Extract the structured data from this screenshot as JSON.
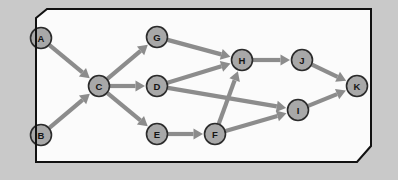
{
  "diagram": {
    "type": "directed-graph",
    "canvas": {
      "width": 398,
      "height": 180
    },
    "colors": {
      "page_background": "#c9c9c9",
      "panel_background": "#fbfbfb",
      "panel_border": "#111111",
      "node_fill": "#a8a8a8",
      "node_border": "#2b2b2b",
      "node_label": "#151515",
      "edge": "#8c8c8c"
    },
    "panel": {
      "points": "36,18 47,9 371,9 371,146 357,162 36,162",
      "bevel_corners": [
        "top-left",
        "bottom-right"
      ]
    },
    "node_radius": 10.5,
    "nodes": [
      {
        "id": "A",
        "label": "A",
        "cx": 41,
        "cy": 38
      },
      {
        "id": "B",
        "label": "B",
        "cx": 41,
        "cy": 135
      },
      {
        "id": "C",
        "label": "C",
        "cx": 99,
        "cy": 86
      },
      {
        "id": "G",
        "label": "G",
        "cx": 157,
        "cy": 37
      },
      {
        "id": "D",
        "label": "D",
        "cx": 157,
        "cy": 86
      },
      {
        "id": "E",
        "label": "E",
        "cx": 157,
        "cy": 134
      },
      {
        "id": "F",
        "label": "F",
        "cx": 215,
        "cy": 134
      },
      {
        "id": "H",
        "label": "H",
        "cx": 242,
        "cy": 60
      },
      {
        "id": "J",
        "label": "J",
        "cx": 302,
        "cy": 60
      },
      {
        "id": "I",
        "label": "I",
        "cx": 298,
        "cy": 110
      },
      {
        "id": "K",
        "label": "K",
        "cx": 357,
        "cy": 86
      }
    ],
    "edges": [
      {
        "from": "A",
        "to": "C",
        "directed": true
      },
      {
        "from": "B",
        "to": "C",
        "directed": true
      },
      {
        "from": "C",
        "to": "G",
        "directed": true
      },
      {
        "from": "C",
        "to": "D",
        "directed": true
      },
      {
        "from": "C",
        "to": "E",
        "directed": true
      },
      {
        "from": "G",
        "to": "H",
        "directed": true
      },
      {
        "from": "D",
        "to": "H",
        "directed": true
      },
      {
        "from": "D",
        "to": "I",
        "directed": true
      },
      {
        "from": "E",
        "to": "F",
        "directed": true
      },
      {
        "from": "F",
        "to": "H",
        "directed": true
      },
      {
        "from": "F",
        "to": "I",
        "directed": true
      },
      {
        "from": "H",
        "to": "J",
        "directed": true
      },
      {
        "from": "J",
        "to": "K",
        "directed": true
      },
      {
        "from": "I",
        "to": "K",
        "directed": true
      }
    ]
  }
}
